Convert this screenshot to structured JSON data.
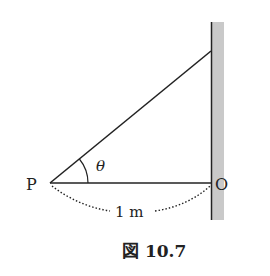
{
  "figure": {
    "caption": "図 10.7",
    "labels": {
      "P": "P",
      "O": "O",
      "theta": "θ",
      "distance": "1 m"
    }
  },
  "colors": {
    "line": "#222222",
    "wall": "#c8c8c8"
  }
}
